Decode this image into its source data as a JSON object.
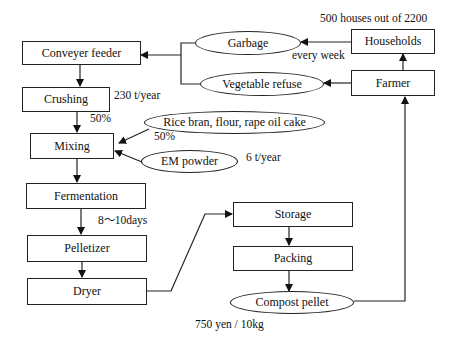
{
  "diagram": {
    "nodes": {
      "conveyer_feeder": "Conveyer feeder",
      "crushing": "Crushing",
      "mixing": "Mixing",
      "fermentation": "Fermentation",
      "pelletizer": "Pelletizer",
      "dryer": "Dryer",
      "storage": "Storage",
      "packing": "Packing",
      "compost_pellet": "Compost pellet",
      "garbage": "Garbage",
      "vegetable_refuse": "Vegetable refuse",
      "households": "Households",
      "farmer": "Farmer",
      "rice_bran": "Rice bran, flour, rape oil cake",
      "em_powder": "EM powder"
    },
    "annotations": {
      "households_count": "500 houses out of  2200",
      "garbage_frequency": "every week",
      "crushing_amount": "230 t/year",
      "crushing_ratio": "50%",
      "rice_bran_ratio": "50%",
      "em_amount": "6 t/year",
      "fermentation_time": "8〜10days",
      "price": "750 yen / 10kg"
    },
    "edges": [
      {
        "from": "Households",
        "to": "Garbage"
      },
      {
        "from": "Farmer",
        "to": "Vegetable refuse"
      },
      {
        "from": "Farmer",
        "to": "Households"
      },
      {
        "from": "Garbage",
        "to": "Conveyer feeder"
      },
      {
        "from": "Vegetable refuse",
        "to": "Conveyer feeder"
      },
      {
        "from": "Conveyer feeder",
        "to": "Crushing"
      },
      {
        "from": "Crushing",
        "to": "Mixing"
      },
      {
        "from": "Rice bran, flour, rape oil cake",
        "to": "Mixing"
      },
      {
        "from": "EM powder",
        "to": "Mixing"
      },
      {
        "from": "Mixing",
        "to": "Fermentation"
      },
      {
        "from": "Fermentation",
        "to": "Pelletizer"
      },
      {
        "from": "Pelletizer",
        "to": "Dryer"
      },
      {
        "from": "Dryer",
        "to": "Storage"
      },
      {
        "from": "Storage",
        "to": "Packing"
      },
      {
        "from": "Packing",
        "to": "Compost pellet"
      },
      {
        "from": "Compost pellet",
        "to": "Farmer"
      }
    ]
  }
}
